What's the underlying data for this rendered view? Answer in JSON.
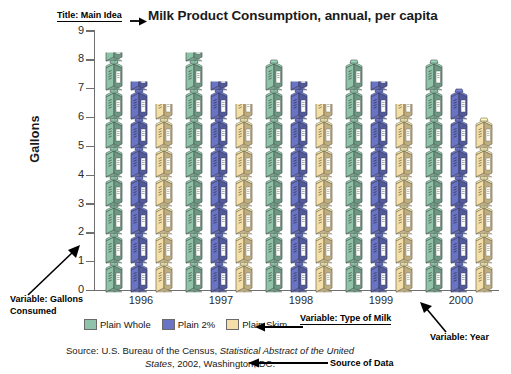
{
  "chart": {
    "title": "Milk Product Consumption, annual, per capita",
    "ylabel": "Gallons",
    "source_line1_prefix": "Source: U.S. Bureau of the Census, ",
    "source_line1_italic": "Statistical Abstract of the United",
    "source_line2_italic": "States",
    "source_line2_rest": ", 2002, Washington, DC."
  },
  "annotations": {
    "title_main_idea": "Title: Main Idea",
    "variable_gallons": "Variable: Gallons Consumed",
    "variable_type": "Variable: Type of Milk",
    "variable_year": "Variable: Year",
    "source_of_data": "Source of Data"
  },
  "legend": {
    "position": "bottom-left",
    "items": [
      {
        "label": "Plain Whole",
        "color": "#8fc2a8"
      },
      {
        "label": "Plain 2%",
        "color": "#6a74c4"
      },
      {
        "label": "Plain Skim",
        "color": "#f5dfa8"
      }
    ]
  },
  "axis": {
    "y_ticks": [
      "9",
      "8",
      "7",
      "6",
      "5",
      "4",
      "3",
      "2",
      "1",
      "0"
    ],
    "x_ticks": [
      "1996",
      "1997",
      "1998",
      "1999",
      "2000"
    ]
  },
  "chart_data": {
    "type": "bar",
    "subtype": "pictograph",
    "title": "Milk Product Consumption, annual, per capita",
    "xlabel": "",
    "ylabel": "Gallons",
    "ylim": [
      0,
      9
    ],
    "grid": false,
    "legend_position": "bottom-left",
    "icon_unit": "1 milk carton = 1 gallon",
    "categories": [
      "1996",
      "1997",
      "1998",
      "1999",
      "2000"
    ],
    "series": [
      {
        "name": "Plain Whole",
        "color": "#8fc2a8",
        "values": [
          8.3,
          8.3,
          8.0,
          8.0,
          8.0
        ]
      },
      {
        "name": "Plain 2%",
        "color": "#6a74c4",
        "values": [
          7.3,
          7.3,
          7.3,
          7.3,
          7.0
        ]
      },
      {
        "name": "Plain Skim",
        "color": "#f5dfa8",
        "values": [
          6.5,
          6.5,
          6.5,
          6.5,
          6.0
        ]
      }
    ]
  }
}
